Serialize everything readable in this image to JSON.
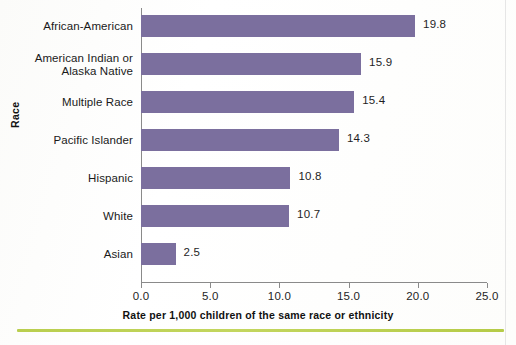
{
  "chart_data": {
    "type": "bar",
    "orientation": "horizontal",
    "title": "",
    "xlabel": "Rate per 1,000 children of the same race or ethnicity",
    "ylabel": "Race",
    "categories": [
      "African-American",
      "American Indian or\nAlaska Native",
      "Multiple Race",
      "Pacific Islander",
      "Hispanic",
      "White",
      "Asian"
    ],
    "values": [
      19.8,
      15.9,
      15.4,
      14.3,
      10.8,
      10.7,
      2.5
    ],
    "value_labels": [
      "19.8",
      "15.9",
      "15.4",
      "14.3",
      "10.8",
      "10.7",
      "2.5"
    ],
    "xlim": [
      0.0,
      25.0
    ],
    "xticks": [
      0.0,
      5.0,
      10.0,
      15.0,
      20.0,
      25.0
    ],
    "xtick_labels": [
      "0.0",
      "5.0",
      "10.0",
      "15.0",
      "20.0",
      "25.0"
    ],
    "grid": false,
    "legend": false,
    "bar_color": "#7b6f9e",
    "axis_color": "#8a8a8a",
    "accent_rule_color": "#b9ce4e"
  },
  "categories": [
    {
      "line1": "African-American",
      "line2": ""
    },
    {
      "line1": "American Indian or",
      "line2": "Alaska Native"
    },
    {
      "line1": "Multiple Race",
      "line2": ""
    },
    {
      "line1": "Pacific Islander",
      "line2": ""
    },
    {
      "line1": "Hispanic",
      "line2": ""
    },
    {
      "line1": "White",
      "line2": ""
    },
    {
      "line1": "Asian",
      "line2": ""
    }
  ]
}
